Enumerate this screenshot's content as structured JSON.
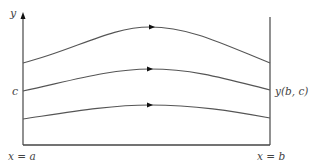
{
  "diagram": {
    "labels": {
      "y_axis": "y",
      "start_value": "c",
      "end_value": "y(b, c)",
      "left_boundary": "x = a",
      "right_boundary": "x = b"
    },
    "colors": {
      "stroke": "#555555",
      "text": "#444444",
      "arrow": "#111111",
      "background": "#ffffff"
    },
    "curves": [
      {
        "name": "upper",
        "start": [
          23,
          63
        ],
        "control": [
          152,
          26
        ],
        "end": [
          270,
          63
        ],
        "arrow_at_x": 152,
        "path": "M23,63 C75,50 110,27 150,27 C190,27 225,45 270,63"
      },
      {
        "name": "middle",
        "start": [
          23,
          91
        ],
        "control": [
          150,
          68
        ],
        "end": [
          270,
          90
        ],
        "arrow_at_x": 150,
        "path": "M23,91 C70,81 110,69 150,69 C195,69 230,80 270,90"
      },
      {
        "name": "lower",
        "start": [
          23,
          119
        ],
        "control": [
          150,
          104
        ],
        "end": [
          270,
          118
        ],
        "arrow_at_x": 150,
        "path": "M23,119 C70,112 110,105 150,105 C195,105 232,111 270,118"
      }
    ],
    "geometry": {
      "left_axis_x": 23,
      "right_line_x": 270,
      "baseline_y": 145,
      "axis_top_y": 14,
      "right_top_y": 17
    }
  }
}
